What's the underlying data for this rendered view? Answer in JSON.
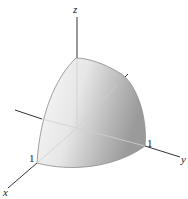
{
  "diagram": {
    "axes": {
      "x": {
        "label": "x",
        "tick_label": "1"
      },
      "y": {
        "label": "y",
        "tick_label": "1"
      },
      "z": {
        "label": "z"
      }
    },
    "colors": {
      "axis": "#333333",
      "surface_light": "#f4f4f4",
      "surface_dark": "#9c9c9c",
      "edge": "#888888",
      "background": "#ffffff"
    }
  }
}
